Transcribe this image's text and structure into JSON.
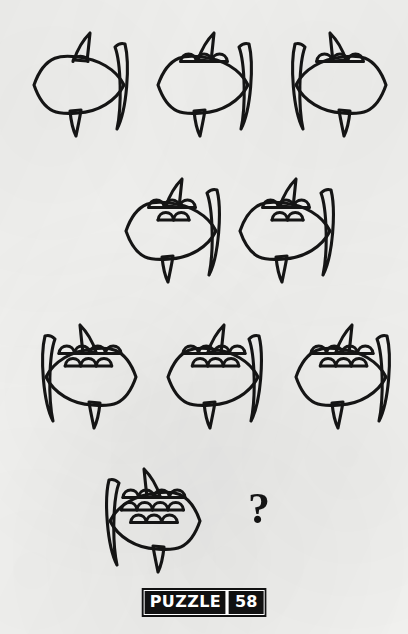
{
  "page": {
    "kind": "visual-logic-puzzle",
    "background_color": "#f3f3f1",
    "ink_color": "#151515",
    "width": 408,
    "height": 634
  },
  "footer": {
    "label": "PUZZLE",
    "number": "58"
  },
  "missing_answer": {
    "glyph": "?"
  },
  "legend": {
    "facing_right": "right",
    "facing_left": "left"
  },
  "rows": [
    {
      "index": 1,
      "fish": [
        {
          "id": "fish-1",
          "facing": "right",
          "scale_rows": 0,
          "scale_counts": [],
          "x": 26,
          "y": 30,
          "w": 118,
          "h": 108,
          "has_fin_notch": true
        },
        {
          "id": "fish-2",
          "facing": "right",
          "scale_rows": 1,
          "scale_counts": [
            3
          ],
          "x": 150,
          "y": 30,
          "w": 118,
          "h": 108,
          "has_fin_notch": true
        },
        {
          "id": "fish-3",
          "facing": "left",
          "scale_rows": 1,
          "scale_counts": [
            3
          ],
          "x": 276,
          "y": 30,
          "w": 118,
          "h": 108,
          "has_fin_notch": true
        }
      ]
    },
    {
      "index": 2,
      "fish": [
        {
          "id": "fish-4",
          "facing": "right",
          "scale_rows": 2,
          "scale_counts": [
            3,
            2
          ],
          "x": 118,
          "y": 176,
          "w": 118,
          "h": 108,
          "has_fin_notch": true
        },
        {
          "id": "fish-5",
          "facing": "right",
          "scale_rows": 2,
          "scale_counts": [
            3,
            2
          ],
          "x": 232,
          "y": 176,
          "w": 118,
          "h": 108,
          "has_fin_notch": true
        }
      ]
    },
    {
      "index": 3,
      "fish": [
        {
          "id": "fish-6",
          "facing": "left",
          "scale_rows": 2,
          "scale_counts": [
            4,
            3
          ],
          "x": 26,
          "y": 322,
          "w": 118,
          "h": 108,
          "has_fin_notch": true
        },
        {
          "id": "fish-7",
          "facing": "right",
          "scale_rows": 2,
          "scale_counts": [
            4,
            3
          ],
          "x": 160,
          "y": 322,
          "w": 118,
          "h": 108,
          "has_fin_notch": true
        },
        {
          "id": "fish-8",
          "facing": "right",
          "scale_rows": 2,
          "scale_counts": [
            4,
            3
          ],
          "x": 288,
          "y": 322,
          "w": 118,
          "h": 108,
          "has_fin_notch": true
        }
      ]
    },
    {
      "index": 4,
      "fish": [
        {
          "id": "fish-9",
          "facing": "left",
          "scale_rows": 3,
          "scale_counts": [
            4,
            4,
            3
          ],
          "x": 90,
          "y": 466,
          "w": 118,
          "h": 108,
          "has_fin_notch": true
        }
      ],
      "answer_slot": {
        "id": "answer-slot",
        "x": 248,
        "y": 487,
        "size": 44
      }
    }
  ]
}
